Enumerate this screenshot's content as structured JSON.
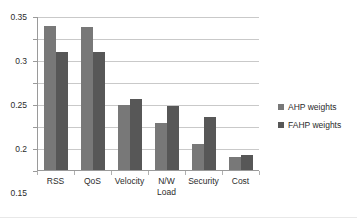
{
  "chart_data": {
    "type": "bar",
    "title": "",
    "subtitle": "",
    "xlabel": "",
    "ylabel": "",
    "categories": [
      "RSS",
      "QoS",
      "Velocity",
      "N/W\nLoad",
      "Security",
      "Cost"
    ],
    "series": [
      {
        "name": "AHP weights",
        "color": "#787878",
        "values": [
          0.327,
          0.326,
          0.148,
          0.107,
          0.058,
          0.03
        ]
      },
      {
        "name": "FAHP weights",
        "color": "#575757",
        "values": [
          0.268,
          0.268,
          0.161,
          0.145,
          0.12,
          0.034
        ]
      }
    ],
    "ylim": [
      0,
      0.35
    ],
    "yticks": [
      0,
      0.05,
      0.1,
      0.15,
      0.2,
      0.25,
      0.3,
      0.35
    ],
    "ytick_labels": [
      "0",
      "0.05",
      "0.1",
      "0.15",
      "0.2",
      "0.25",
      "0.3",
      "0.35"
    ],
    "grid": true,
    "grid_axis": "y",
    "legend_position": "right",
    "axis_color": "#9a9a9a",
    "grid_color": "#c9c9c9",
    "background": "#ffffff"
  }
}
